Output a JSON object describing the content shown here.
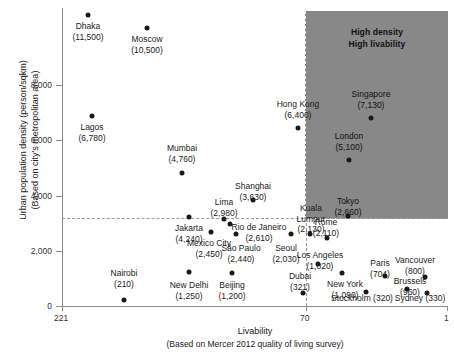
{
  "chart_data": {
    "type": "scatter",
    "title": "",
    "xlabel": "Livability",
    "xlabel_sub": "(Based on Mercer 2012 quality of living survey)",
    "ylabel": "Urban population density (person/sqkm)",
    "ylabel_sub": "(Based on city's metropolitan area)",
    "xlim": [
      221,
      1
    ],
    "ylim": [
      0,
      12400
    ],
    "x_reversed": true,
    "xticks": [
      "221",
      "70",
      "1"
    ],
    "xtick_values": [
      221,
      70,
      1
    ],
    "yticks": [
      "0",
      "2,000",
      "4,000",
      "6,000",
      "8,000"
    ],
    "ytick_values": [
      0,
      2000,
      4000,
      6000,
      8000
    ],
    "grid": false,
    "legend": "none",
    "annotations": {
      "highlight_region": {
        "line1": "High density",
        "line2": "High livability",
        "x_range": [
          70,
          1
        ],
        "y_range": [
          3190,
          12400
        ],
        "color": "#6e6e6e"
      },
      "density_threshold_line": 3190,
      "livability_threshold_line": 70
    },
    "points": [
      {
        "city": "Dhaka",
        "density": 11500,
        "density_label": "(11,500)",
        "livability_rank": 210
      },
      {
        "city": "Moscow",
        "density": 10500,
        "density_label": "(10,500)",
        "livability_rank": 163
      },
      {
        "city": "Lagos",
        "density": 6780,
        "density_label": "(6,780)",
        "livability_rank": 208
      },
      {
        "city": "Singapore",
        "density": 7130,
        "density_label": "(7,130)",
        "livability_rank": 25
      },
      {
        "city": "Hong Kong",
        "density": 6400,
        "density_label": "(6,400)",
        "livability_rank": 70
      },
      {
        "city": "London",
        "density": 5100,
        "density_label": "(5,100)",
        "livability_rank": 38
      },
      {
        "city": "Mumbai",
        "density": 4760,
        "density_label": "(4,760)",
        "livability_rank": 145
      },
      {
        "city": "Shanghai",
        "density": 3630,
        "density_label": "(3,630)",
        "livability_rank": 95
      },
      {
        "city": "Lima",
        "density": 2980,
        "density_label": "(2,980)",
        "livability_rank": 124
      },
      {
        "city": "Jakarta",
        "density": 4240,
        "density_label": "(4,240)",
        "livability_rank": 140
      },
      {
        "city": "Rio de Janeiro",
        "density": 2610,
        "density_label": "(2,610)",
        "livability_rank": 110
      },
      {
        "city": "Mexico City",
        "density": 2450,
        "density_label": "(2,450)",
        "livability_rank": 121
      },
      {
        "city": "Sao Paulo",
        "density": 2440,
        "density_label": "(2,440)",
        "livability_rank": 118
      },
      {
        "city": "Seoul",
        "density": 2030,
        "density_label": "(2,030)",
        "livability_rank": 75
      },
      {
        "city": "Kuala Lumpur",
        "density": 2130,
        "density_label": "(2,130)",
        "livability_rank": 79
      },
      {
        "city": "Tokyo",
        "density": 2660,
        "density_label": "(2,660)",
        "livability_rank": 44
      },
      {
        "city": "Rome",
        "density": 2110,
        "density_label": "(2,110)",
        "livability_rank": 52
      },
      {
        "city": "Los Angeles",
        "density": 1020,
        "density_label": "(1,020)",
        "livability_rank": 55
      },
      {
        "city": "Dubai",
        "density": 321,
        "density_label": "(321)",
        "livability_rank": 74
      },
      {
        "city": "New York",
        "density": 1090,
        "density_label": "(1,090)",
        "livability_rank": 47
      },
      {
        "city": "Paris",
        "density": 704,
        "density_label": "(704)",
        "livability_rank": 30
      },
      {
        "city": "Brussels",
        "density": 960,
        "density_label": "(960)",
        "livability_rank": 22
      },
      {
        "city": "Vancouver",
        "density": 800,
        "density_label": "(800)",
        "livability_rank": 5
      },
      {
        "city": "Stockholm",
        "density": 320,
        "density_label": "(320)",
        "livability_rank": 20
      },
      {
        "city": "Sydney",
        "density": 330,
        "density_label": "(330)",
        "livability_rank": 10
      },
      {
        "city": "Nairobi",
        "density": 210,
        "density_label": "(210)",
        "livability_rank": 184
      },
      {
        "city": "New Delhi",
        "density": 1250,
        "density_label": "(1,250)",
        "livability_rank": 143
      },
      {
        "city": "Beijing",
        "density": 1200,
        "density_label": "(1,200)",
        "livability_rank": 113
      }
    ]
  },
  "render": {
    "points_px": [
      {
        "name": "Dhaka",
        "cx": 88,
        "cy": 15,
        "label": "Dhaka",
        "value": "(11,500)",
        "lx": 88,
        "ly": 21,
        "pos": "center",
        "dark": false
      },
      {
        "name": "Moscow",
        "cx": 147,
        "cy": 28,
        "label": "Moscow",
        "value": "(10,500)",
        "lx": 147,
        "ly": 34,
        "pos": "center",
        "dark": false
      },
      {
        "name": "Lagos",
        "cx": 92,
        "cy": 116,
        "label": "Lagos",
        "value": "(6,780)",
        "lx": 92,
        "ly": 122,
        "pos": "center",
        "dark": false
      },
      {
        "name": "Mumbai",
        "cx": 182,
        "cy": 173,
        "label": "Mumbai",
        "value": "(4,760)",
        "lx": 182,
        "ly": 143,
        "pos": "center",
        "dark": false
      },
      {
        "name": "Hong Kong",
        "cx": 298,
        "cy": 128,
        "label": "Hong Kong",
        "value": "(6,400)",
        "lx": 298,
        "ly": 99,
        "pos": "center",
        "dark": false
      },
      {
        "name": "Singapore",
        "cx": 371,
        "cy": 118,
        "label": "Singapore",
        "value": "(7,130)",
        "lx": 371,
        "ly": 89,
        "pos": "center",
        "dark": true
      },
      {
        "name": "London",
        "cx": 349,
        "cy": 160,
        "label": "London",
        "value": "(5,100)",
        "lx": 349,
        "ly": 131,
        "pos": "center",
        "dark": true
      },
      {
        "name": "Shanghai",
        "cx": 253,
        "cy": 200,
        "label": "Shanghai",
        "value": "(3,630)",
        "lx": 253,
        "ly": 181,
        "pos": "center",
        "dark": false
      },
      {
        "name": "Jakarta",
        "cx": 189,
        "cy": 217,
        "label": "Jakarta",
        "value": "(4,240)",
        "lx": 189,
        "ly": 223,
        "pos": "center",
        "dark": false
      },
      {
        "name": "Lima",
        "cx": 224,
        "cy": 219,
        "label": "Lima",
        "value": "(2,980)",
        "lx": 224,
        "ly": 197,
        "pos": "center",
        "dark": false
      },
      {
        "name": "Rio de Janeiro",
        "cx": 230,
        "cy": 224,
        "label": "Rio de Janeiro",
        "value": "(2,610)",
        "lx": 259,
        "ly": 222,
        "pos": "center",
        "dark": false
      },
      {
        "name": "Mexico City",
        "cx": 211,
        "cy": 232,
        "label": "Mexico City",
        "value": "(2,450)",
        "lx": 209,
        "ly": 238,
        "pos": "center",
        "dark": false
      },
      {
        "name": "Sao Paulo",
        "cx": 236,
        "cy": 234,
        "label": "São Paulo",
        "value": "(2,440)",
        "lx": 241,
        "ly": 243,
        "pos": "center",
        "dark": false
      },
      {
        "name": "Kuala Lumpur",
        "cx": 310,
        "cy": 234,
        "label": "Kuala",
        "value": "Lumpur",
        "lx": 311,
        "ly": 203,
        "pos": "center",
        "dark": false
      },
      {
        "name": "Kuala Lumpur2",
        "cx": -99,
        "cy": -99,
        "label": "(2,130)",
        "value": "",
        "lx": 311,
        "ly": 224,
        "pos": "center",
        "dark": false
      },
      {
        "name": "Seoul",
        "cx": 291,
        "cy": 234,
        "label": "Seoul",
        "value": "(2,030)",
        "lx": 286,
        "ly": 243,
        "pos": "center",
        "dark": false
      },
      {
        "name": "Tokyo",
        "cx": 348,
        "cy": 216,
        "label": "Tokyo",
        "value": "(2,660)",
        "lx": 348,
        "ly": 196,
        "pos": "center",
        "dark": true
      },
      {
        "name": "Rome",
        "cx": 327,
        "cy": 238,
        "label": "Rome",
        "value": "(2,110)",
        "lx": 326,
        "ly": 217,
        "pos": "center",
        "dark": false
      },
      {
        "name": "Los Angeles",
        "cx": 318,
        "cy": 264,
        "label": "Los Angeles",
        "value": "(1,020)",
        "lx": 320,
        "ly": 250,
        "pos": "center",
        "dark": false
      },
      {
        "name": "Dubai",
        "cx": 303,
        "cy": 293,
        "label": "Dubai",
        "value": "(321)",
        "lx": 300,
        "ly": 271,
        "pos": "center",
        "dark": false
      },
      {
        "name": "New York",
        "cx": 342,
        "cy": 273,
        "label": "New York",
        "value": "(1,090)",
        "lx": 345,
        "ly": 279,
        "pos": "center",
        "dark": false
      },
      {
        "name": "Paris",
        "cx": 385,
        "cy": 276,
        "label": "Paris",
        "value": "(704)",
        "lx": 380,
        "ly": 258,
        "pos": "center",
        "dark": false
      },
      {
        "name": "Brussels",
        "cx": 407,
        "cy": 289,
        "label": "Brussels",
        "value": "(960)",
        "lx": 410,
        "ly": 276,
        "pos": "center",
        "dark": false
      },
      {
        "name": "Vancouver",
        "cx": 425,
        "cy": 277,
        "label": "Vancouver",
        "value": "(800)",
        "lx": 415,
        "ly": 255,
        "pos": "center",
        "dark": false
      },
      {
        "name": "Stockholm",
        "cx": 366,
        "cy": 292,
        "label": "Stockholm (320)",
        "value": "",
        "lx": 362,
        "ly": 293,
        "pos": "center",
        "dark": false
      },
      {
        "name": "Sydney",
        "cx": 427,
        "cy": 293,
        "label": "Sydney (330)",
        "value": "",
        "lx": 420,
        "ly": 293,
        "pos": "center",
        "dark": false
      },
      {
        "name": "Nairobi",
        "cx": 124,
        "cy": 300,
        "label": "Nairobi",
        "value": "(210)",
        "lx": 124,
        "ly": 268,
        "pos": "center",
        "dark": false
      },
      {
        "name": "New Delhi",
        "cx": 189,
        "cy": 272,
        "label": "New Delhi",
        "value": "(1,250)",
        "lx": 189,
        "ly": 280,
        "pos": "center",
        "dark": false
      },
      {
        "name": "Beijing",
        "cx": 232,
        "cy": 273,
        "label": "Beijing",
        "value": "(1,200)",
        "lx": 232,
        "ly": 280,
        "pos": "center",
        "dark": false
      }
    ]
  }
}
